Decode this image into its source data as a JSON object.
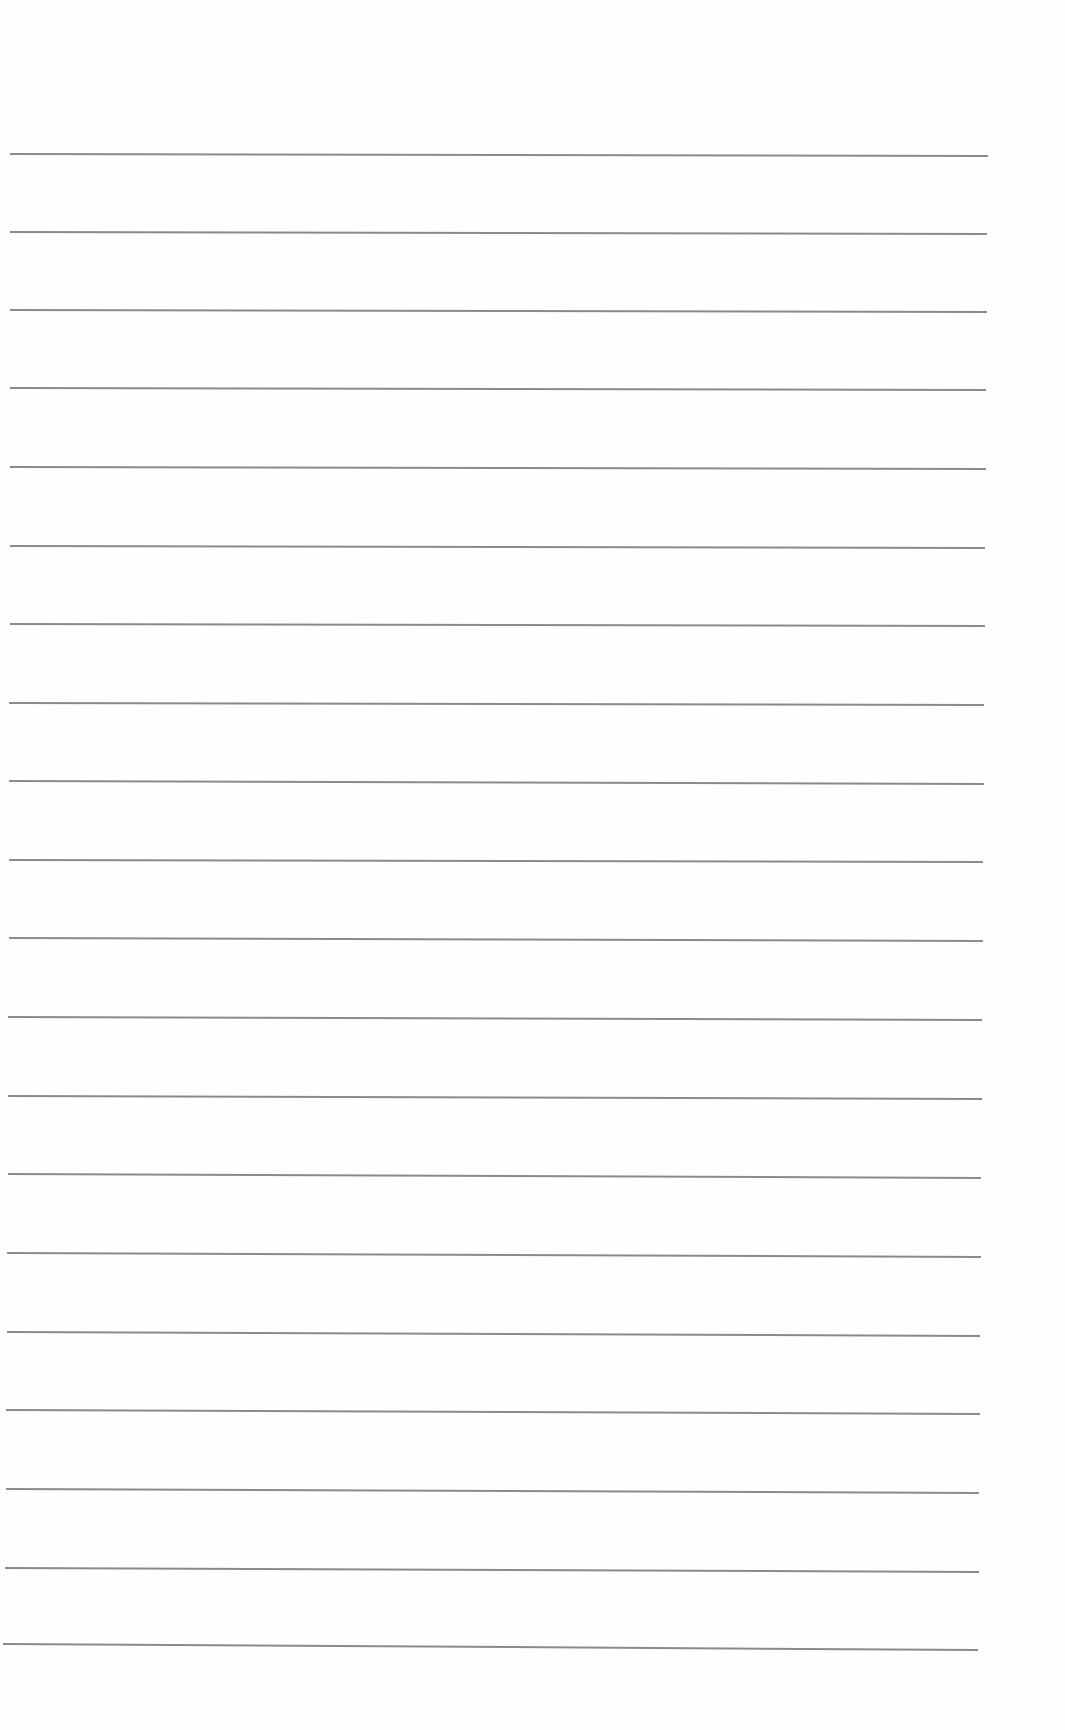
{
  "page": {
    "type": "lined notebook page",
    "background_color": "#fefefe",
    "rule_color": "#8a8a8a",
    "rules": [
      {
        "y_left": 153,
        "y_right": 155,
        "x_start": 10,
        "x_end": 988
      },
      {
        "y_left": 231,
        "y_right": 233,
        "x_start": 10,
        "x_end": 987
      },
      {
        "y_left": 309,
        "y_right": 311,
        "x_start": 10,
        "x_end": 987
      },
      {
        "y_left": 387,
        "y_right": 389,
        "x_start": 10,
        "x_end": 986
      },
      {
        "y_left": 466,
        "y_right": 468,
        "x_start": 10,
        "x_end": 986
      },
      {
        "y_left": 545,
        "y_right": 547,
        "x_start": 10,
        "x_end": 985
      },
      {
        "y_left": 623,
        "y_right": 625,
        "x_start": 10,
        "x_end": 985
      },
      {
        "y_left": 702,
        "y_right": 704,
        "x_start": 9,
        "x_end": 984
      },
      {
        "y_left": 780,
        "y_right": 783,
        "x_start": 9,
        "x_end": 984
      },
      {
        "y_left": 859,
        "y_right": 861,
        "x_start": 9,
        "x_end": 983
      },
      {
        "y_left": 937,
        "y_right": 940,
        "x_start": 9,
        "x_end": 983
      },
      {
        "y_left": 1016,
        "y_right": 1019,
        "x_start": 8,
        "x_end": 982
      },
      {
        "y_left": 1095,
        "y_right": 1098,
        "x_start": 8,
        "x_end": 982
      },
      {
        "y_left": 1173,
        "y_right": 1177,
        "x_start": 8,
        "x_end": 981
      },
      {
        "y_left": 1252,
        "y_right": 1256,
        "x_start": 7,
        "x_end": 981
      },
      {
        "y_left": 1331,
        "y_right": 1335,
        "x_start": 7,
        "x_end": 980
      },
      {
        "y_left": 1409,
        "y_right": 1413,
        "x_start": 6,
        "x_end": 980
      },
      {
        "y_left": 1488,
        "y_right": 1492,
        "x_start": 6,
        "x_end": 979
      },
      {
        "y_left": 1567,
        "y_right": 1571,
        "x_start": 5,
        "x_end": 979
      },
      {
        "y_left": 1643,
        "y_right": 1649,
        "x_start": 3,
        "x_end": 978
      }
    ],
    "bleed_marks": [
      {
        "x": 1040,
        "y": 866
      },
      {
        "x": 1040,
        "y": 944
      },
      {
        "x": 1045,
        "y": 1022
      },
      {
        "x": 1040,
        "y": 1101
      },
      {
        "x": 1040,
        "y": 1180
      }
    ]
  }
}
